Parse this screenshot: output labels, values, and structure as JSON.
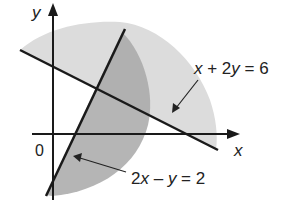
{
  "diagram": {
    "type": "graph of linear inequalities",
    "axes": {
      "x_label": "x",
      "y_label": "y",
      "origin_label": "0"
    },
    "lines": [
      {
        "id": "line1",
        "equation_parts": [
          "x",
          " + 2",
          "y",
          " = 6"
        ],
        "equation": "x + 2y = 6"
      },
      {
        "id": "line2",
        "equation_parts": [
          "2",
          "x",
          " – ",
          "y",
          " = 2"
        ],
        "equation": "2x – y = 2"
      }
    ],
    "regions": [
      {
        "name": "light-shaded-region",
        "color": "#dcdcdc"
      },
      {
        "name": "dark-shaded-region",
        "color": "#a9a9a9"
      }
    ],
    "colors": {
      "line": "#1a1a1a",
      "light_region": "#dcdcdc",
      "dark_region": "#a9a9a9",
      "background": "#ffffff"
    }
  }
}
